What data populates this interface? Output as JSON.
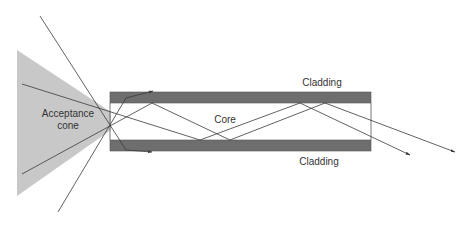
{
  "diagram": {
    "labels": {
      "acceptance_cone": "Acceptance cone",
      "core": "Core",
      "cladding_top": "Cladding",
      "cladding_bottom": "Cladding"
    },
    "colors": {
      "cone_fill": "#c8c8c8",
      "cladding_fill": "#6e6e6e",
      "ray_stroke": "#3a3a3a",
      "background": "#ffffff"
    }
  }
}
